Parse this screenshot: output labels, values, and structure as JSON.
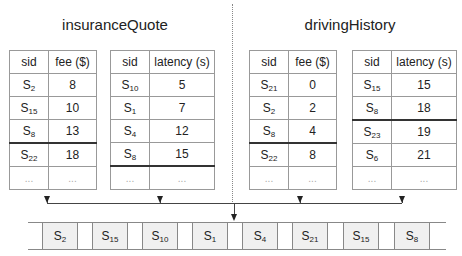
{
  "sections": [
    {
      "title": "insuranceQuote",
      "tables": [
        {
          "headers": [
            "sid",
            "fee ($)"
          ],
          "rows": [
            {
              "sid": "S",
              "sub": "2",
              "value": "8"
            },
            {
              "sid": "S",
              "sub": "15",
              "value": "10"
            },
            {
              "sid": "S",
              "sub": "8",
              "value": "13"
            },
            {
              "sid": "S",
              "sub": "22",
              "value": "18"
            },
            {
              "sid": "...",
              "sub": "",
              "value": "..."
            }
          ],
          "separator_before_row": 3
        },
        {
          "headers": [
            "sid",
            "latency (s)"
          ],
          "rows": [
            {
              "sid": "S",
              "sub": "10",
              "value": "5"
            },
            {
              "sid": "S",
              "sub": "1",
              "value": "7"
            },
            {
              "sid": "S",
              "sub": "4",
              "value": "12"
            },
            {
              "sid": "S",
              "sub": "8",
              "value": "15"
            },
            {
              "sid": "...",
              "sub": "",
              "value": "..."
            }
          ],
          "separator_before_row": 4
        }
      ]
    },
    {
      "title": "drivingHistory",
      "tables": [
        {
          "headers": [
            "sid",
            "fee ($)"
          ],
          "rows": [
            {
              "sid": "S",
              "sub": "21",
              "value": "0"
            },
            {
              "sid": "S",
              "sub": "2",
              "value": "2"
            },
            {
              "sid": "S",
              "sub": "8",
              "value": "4"
            },
            {
              "sid": "S",
              "sub": "22",
              "value": "8"
            },
            {
              "sid": "...",
              "sub": "",
              "value": "..."
            }
          ],
          "separator_before_row": 3
        },
        {
          "headers": [
            "sid",
            "latency (s)"
          ],
          "rows": [
            {
              "sid": "S",
              "sub": "15",
              "value": "15"
            },
            {
              "sid": "S",
              "sub": "8",
              "value": "18"
            },
            {
              "sid": "S",
              "sub": "23",
              "value": "19"
            },
            {
              "sid": "S",
              "sub": "6",
              "value": "21"
            },
            {
              "sid": "...",
              "sub": "",
              "value": "..."
            }
          ],
          "separator_before_row": 2
        }
      ]
    }
  ],
  "output_sequence": [
    {
      "sid": "S",
      "sub": "2"
    },
    {
      "sid": "S",
      "sub": "15"
    },
    {
      "sid": "S",
      "sub": "10"
    },
    {
      "sid": "S",
      "sub": "1"
    },
    {
      "sid": "S",
      "sub": "4"
    },
    {
      "sid": "S",
      "sub": "21"
    },
    {
      "sid": "S",
      "sub": "15"
    },
    {
      "sid": "S",
      "sub": "8"
    }
  ]
}
